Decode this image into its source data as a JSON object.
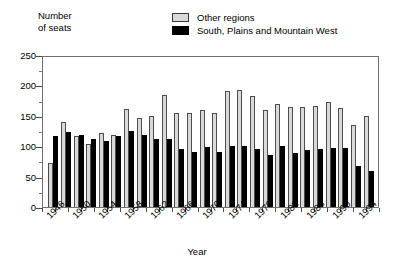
{
  "axis_titles": {
    "y": "Number\nof seats",
    "x": "Year"
  },
  "legend": {
    "position": "top-center",
    "entries": [
      {
        "label": "Other regions",
        "swatch": "light-gray-box",
        "color": "#d9d9d9"
      },
      {
        "label": "South, Plains and Mountain West",
        "swatch": "black-box",
        "color": "#000000"
      }
    ]
  },
  "chart_data": {
    "type": "bar",
    "title": "",
    "subtitle": "",
    "xlabel": "Year",
    "ylabel": "Number of seats",
    "ylim": [
      0,
      250
    ],
    "yticks": [
      0,
      50,
      100,
      150,
      200,
      250
    ],
    "ytick_labels": [
      "0",
      "50",
      "100",
      "150",
      "200",
      "250"
    ],
    "grid": false,
    "legend_position": "top-center",
    "categories": [
      "1946",
      "1948",
      "1950",
      "1952",
      "1954",
      "1956",
      "1958",
      "1960",
      "1962",
      "1964",
      "1966",
      "1968",
      "1970",
      "1972",
      "1974",
      "1976",
      "1978",
      "1980",
      "1982",
      "1984",
      "1986",
      "1988",
      "1990",
      "1992",
      "1994",
      "1996"
    ],
    "xtick_labels": [
      "1946",
      "1950",
      "1954",
      "1958",
      "1962",
      "1966",
      "1970",
      "1974",
      "1978",
      "1982",
      "1986",
      "1990",
      "1994"
    ],
    "xtick_label_indices": [
      0,
      2,
      4,
      6,
      8,
      10,
      12,
      14,
      16,
      18,
      20,
      22,
      24
    ],
    "series": [
      {
        "name": "Other regions",
        "color": "#d9d9d9",
        "values": [
          72,
          140,
          117,
          103,
          121,
          119,
          161,
          147,
          149,
          185,
          154,
          154,
          160,
          154,
          191,
          193,
          182,
          160,
          170,
          165,
          165,
          166,
          172,
          163,
          135,
          150
        ]
      },
      {
        "name": "South, Plains and Mountain West",
        "color": "#000000",
        "values": [
          117,
          124,
          119,
          112,
          109,
          117,
          125,
          118,
          112,
          112,
          96,
          90,
          99,
          91,
          101,
          100,
          95,
          85,
          100,
          89,
          94,
          95,
          97,
          97,
          68,
          59
        ]
      }
    ]
  }
}
